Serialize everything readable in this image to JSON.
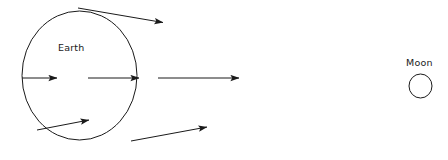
{
  "figure": {
    "background_color": "#ffffff",
    "stroke_color": "#1a1a1a",
    "width": 448,
    "height": 160
  },
  "bodies": [
    {
      "id": "earth",
      "label": "Earth",
      "label_x": 58,
      "label_y": 51,
      "center_x": 79.5,
      "center_y": 75.5,
      "radius_x": 57.5,
      "radius_y": 64.5,
      "shape": "ellipse"
    },
    {
      "id": "moon",
      "label": "Moon",
      "label_x": 406,
      "label_y": 66,
      "center_x": 420.5,
      "center_y": 86,
      "radius_x": 11.5,
      "radius_y": 12,
      "shape": "ellipse"
    }
  ],
  "vectors": [
    {
      "id": "vector-top",
      "description": "tidal force vector at Earth upper limb, angled down-right toward Moon",
      "x1": 78,
      "y1": 8,
      "x2": 163,
      "y2": 22.5,
      "arrowhead": "filled-triangle"
    },
    {
      "id": "vector-center-left",
      "description": "gravitational vector at Earth near side interior, pointing right",
      "x1": 22,
      "y1": 78,
      "x2": 57,
      "y2": 78,
      "arrowhead": "filled-triangle"
    },
    {
      "id": "vector-center-middle",
      "description": "gravitational vector at Earth center, pointing right toward Moon",
      "x1": 88,
      "y1": 78,
      "x2": 139,
      "y2": 78,
      "arrowhead": "filled-triangle"
    },
    {
      "id": "vector-center-right",
      "description": "strongest gravitational vector at Earth near side, pointing right toward Moon",
      "x1": 158,
      "y1": 78,
      "x2": 239,
      "y2": 78,
      "arrowhead": "filled-triangle"
    },
    {
      "id": "vector-bottom-left",
      "description": "tidal force vector at Earth lower far side, angled up-right",
      "x1": 37,
      "y1": 130,
      "x2": 89,
      "y2": 120,
      "arrowhead": "filled-triangle"
    },
    {
      "id": "vector-bottom-right",
      "description": "tidal force vector at Earth lower limb, angled up-right toward Moon",
      "x1": 131,
      "y1": 141,
      "x2": 207,
      "y2": 127,
      "arrowhead": "filled-triangle"
    }
  ]
}
